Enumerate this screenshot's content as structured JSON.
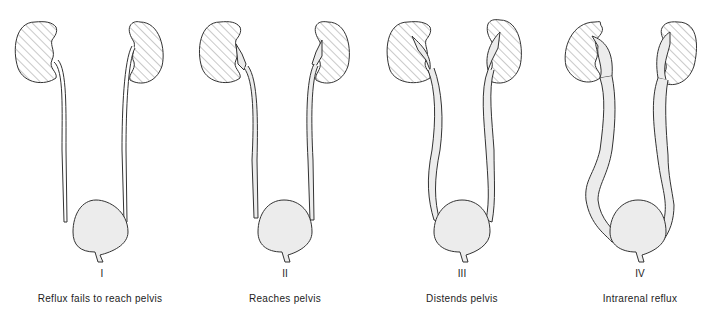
{
  "panels": [
    {
      "grade": "I",
      "caption": "Reflux fails to reach pelvis"
    },
    {
      "grade": "II",
      "caption": "Reaches pelvis"
    },
    {
      "grade": "III",
      "caption": "Distends pelvis"
    },
    {
      "grade": "IV",
      "caption": "Intrarenal reflux"
    }
  ],
  "colors": {
    "line": "#333333",
    "fill": "#ececec",
    "hatch": "#777777",
    "background": "#ffffff"
  }
}
